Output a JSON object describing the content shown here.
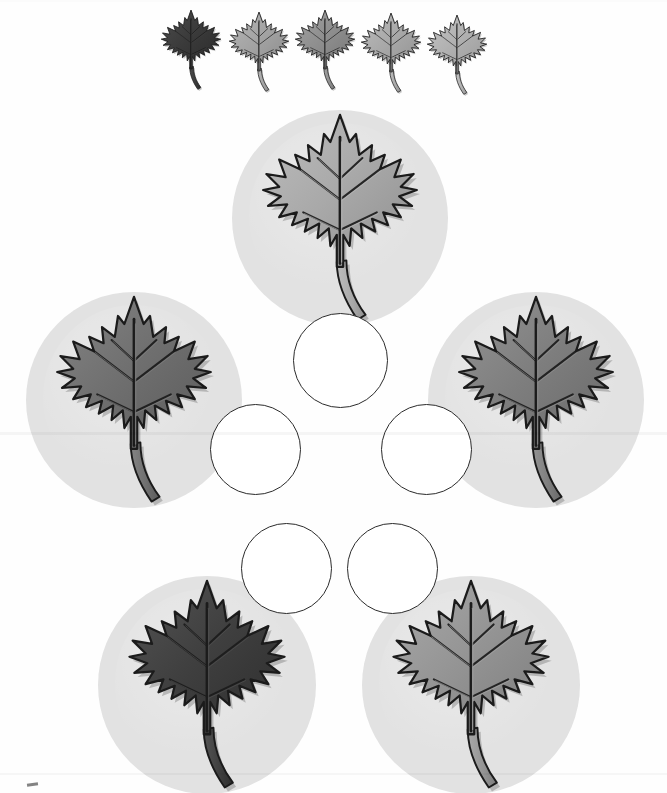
{
  "page": {
    "background_color": "#fefefe",
    "width": 667,
    "height": 793
  },
  "legend": {
    "name": "leaf-shade-key",
    "description": "Row of five small maple leaves ordered from darkest to lightest",
    "count": 5,
    "leaves": [
      {
        "index": 1,
        "shade_name": "darkest",
        "fill": "#3a3a3a",
        "shadow": "#2a2a2a",
        "highlight": "#4c4c4c",
        "x": 0,
        "y": 0
      },
      {
        "index": 2,
        "shade_name": "light",
        "fill": "#a3a3a3",
        "shadow": "#8a8a8a",
        "highlight": "#b6b6b6",
        "x": 68,
        "y": 2
      },
      {
        "index": 3,
        "shade_name": "medium",
        "fill": "#8e8e8e",
        "shadow": "#767676",
        "highlight": "#a2a2a2",
        "x": 134,
        "y": 0
      },
      {
        "index": 4,
        "shade_name": "lighter",
        "fill": "#a8a8a8",
        "shadow": "#909090",
        "highlight": "#bcbcbc",
        "x": 200,
        "y": 3
      },
      {
        "index": 5,
        "shade_name": "lightest",
        "fill": "#b0b0b0",
        "shadow": "#989898",
        "highlight": "#c4c4c4",
        "x": 266,
        "y": 5
      }
    ]
  },
  "disks": {
    "name": "leaf-disk-group",
    "description": "Five large leaves on light gray circular disks arranged in a pentagon",
    "disk_color": "#e2e2e2",
    "count": 5,
    "items": [
      {
        "position_name": "top",
        "shade_name": "light-gray",
        "fill": "#a9a9a9",
        "shadow": "#8f8f8f",
        "highlight": "#bdbdbd",
        "x": 232,
        "y": 110,
        "size": 216
      },
      {
        "position_name": "left",
        "shade_name": "dark-gray",
        "fill": "#6f6f6f",
        "shadow": "#5a5a5a",
        "highlight": "#848484",
        "x": 26,
        "y": 292,
        "size": 216
      },
      {
        "position_name": "right",
        "shade_name": "medium-gray",
        "fill": "#7e7e7e",
        "shadow": "#686868",
        "highlight": "#949494",
        "x": 428,
        "y": 292,
        "size": 216
      },
      {
        "position_name": "bottom-left",
        "shade_name": "darkest",
        "fill": "#3f3f3f",
        "shadow": "#2d2d2d",
        "highlight": "#545454",
        "x": 98,
        "y": 576,
        "size": 218
      },
      {
        "position_name": "bottom-right",
        "shade_name": "medium-light-gray",
        "fill": "#949494",
        "shadow": "#7c7c7c",
        "highlight": "#a9a9a9",
        "x": 362,
        "y": 576,
        "size": 218
      }
    ]
  },
  "answers": {
    "name": "answer-circle-group",
    "description": "Five empty circles in the center for writing answers",
    "count": 5,
    "border_color": "#2b2b2b",
    "fill_color": "#ffffff",
    "circles": [
      {
        "slot": 1,
        "position_name": "top",
        "value": "",
        "x": 293,
        "y": 313,
        "size": 95
      },
      {
        "slot": 2,
        "position_name": "left",
        "value": "",
        "x": 210,
        "y": 404,
        "size": 91
      },
      {
        "slot": 3,
        "position_name": "right",
        "value": "",
        "x": 381,
        "y": 404,
        "size": 91
      },
      {
        "slot": 4,
        "position_name": "bottom-left",
        "value": "",
        "x": 241,
        "y": 523,
        "size": 91
      },
      {
        "slot": 5,
        "position_name": "bottom-right",
        "value": "",
        "x": 347,
        "y": 523,
        "size": 91
      }
    ]
  },
  "corner_mark": {
    "name": "faint-pencil-mark",
    "visible": true
  }
}
